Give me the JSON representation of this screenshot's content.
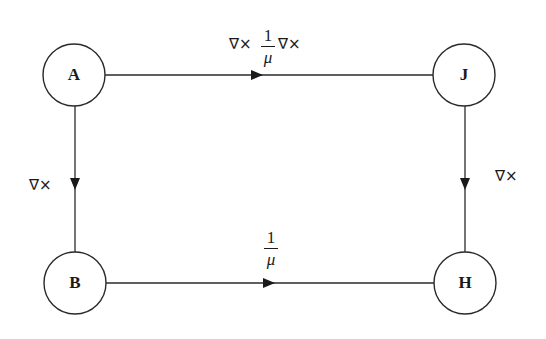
{
  "diagram": {
    "type": "commutative-diagram",
    "colors": {
      "stroke": "#2a2a2a",
      "text": "#1a1a1a",
      "background": "#ffffff"
    },
    "nodes": [
      {
        "id": "A",
        "label": "A",
        "position": "top-left"
      },
      {
        "id": "J",
        "label": "J",
        "position": "top-right"
      },
      {
        "id": "B",
        "label": "B",
        "position": "bottom-left"
      },
      {
        "id": "H",
        "label": "H",
        "position": "bottom-right"
      }
    ],
    "edges": [
      {
        "from": "A",
        "to": "J",
        "label_prefix": "∇×",
        "label_frac_num": "1",
        "label_frac_den": "μ",
        "label_suffix": "∇×",
        "label_text": "∇× (1/μ) ∇×"
      },
      {
        "from": "A",
        "to": "B",
        "label_text": "∇×"
      },
      {
        "from": "J",
        "to": "H",
        "label_text": "∇×"
      },
      {
        "from": "B",
        "to": "H",
        "label_frac_num": "1",
        "label_frac_den": "μ",
        "label_text": "1/μ"
      }
    ]
  }
}
